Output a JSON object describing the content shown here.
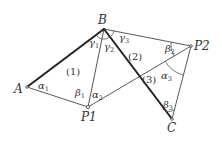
{
  "diagram": {
    "type": "triangulation",
    "points": {
      "A": {
        "label": "A",
        "x": 27,
        "y": 87
      },
      "B": {
        "label": "B",
        "x": 104,
        "y": 29
      },
      "P1": {
        "label": "P1",
        "x": 88,
        "y": 107
      },
      "P2": {
        "label": "P2",
        "x": 191,
        "y": 46
      },
      "C": {
        "label": "C",
        "x": 172,
        "y": 119
      }
    },
    "thick_lines": [
      "A-B",
      "B-C"
    ],
    "thin_lines": [
      "A-P1",
      "B-P1",
      "B-P2",
      "P1-P2",
      "P2-C"
    ],
    "regions": {
      "r1": "(1)",
      "r2": "(2)",
      "r3": "(3)"
    },
    "angles": {
      "alpha1": {
        "symbol": "α",
        "sub": "1"
      },
      "alpha2": {
        "symbol": "α",
        "sub": "2"
      },
      "alpha3": {
        "symbol": "α",
        "sub": "3"
      },
      "beta1": {
        "symbol": "β",
        "sub": "1"
      },
      "beta2": {
        "symbol": "β",
        "sub": "2"
      },
      "beta3": {
        "symbol": "β",
        "sub": "3"
      },
      "gamma1": {
        "symbol": "γ",
        "sub": "1"
      },
      "gamma2": {
        "symbol": "γ",
        "sub": "2"
      },
      "gamma3": {
        "symbol": "γ",
        "sub": "3"
      }
    },
    "colors": {
      "line": "#333333",
      "thick_line": "#222222",
      "background": "#ffffff"
    }
  }
}
